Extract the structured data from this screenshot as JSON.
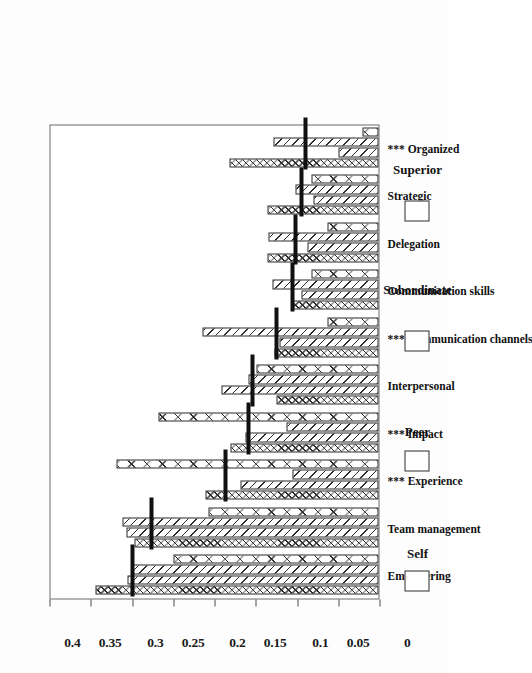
{
  "chart_data": {
    "type": "bar",
    "title": "",
    "xlabel": "",
    "ylabel": "",
    "ylim": [
      0,
      0.4
    ],
    "yticks": [
      "0",
      "0.05",
      "0.1",
      "0.15",
      "0.2",
      "0.25",
      "0.3",
      "0.35",
      "0.4"
    ],
    "ytick_values": [
      0,
      0.05,
      0.1,
      0.15,
      0.2,
      0.25,
      0.3,
      0.35,
      0.4
    ],
    "grid": false,
    "orientation": "vertical-bars-rotated-90",
    "legend_position": "bottom",
    "categories": [
      "Empowering",
      "Team management",
      "*** Experience",
      "*** Impact",
      "Interpersonal",
      "*** Communication channels",
      "Communication skills",
      "Delegation",
      "Strategic",
      "*** Organized"
    ],
    "series": [
      {
        "name": "Self",
        "pattern": "cross-hatch-dense",
        "values": [
          0.343,
          0.296,
          0.21,
          0.18,
          0.124,
          0.126,
          0.105,
          0.134,
          0.134,
          0.181
        ]
      },
      {
        "name": "Peer",
        "pattern": "diagonal-hatch",
        "values": [
          0.304,
          0.306,
          0.167,
          0.161,
          0.19,
          0.12,
          0.093,
          0.086,
          0.079,
          0.048
        ]
      },
      {
        "name": "Subordinate",
        "pattern": "diagonal-hatch-light",
        "values": [
          0.3,
          0.31,
          0.104,
          0.112,
          0.157,
          0.213,
          0.128,
          0.133,
          0.101,
          0.127
        ]
      },
      {
        "name": "Superior",
        "pattern": "cross-hatch-wide",
        "values": [
          0.248,
          0.206,
          0.317,
          0.267,
          0.148,
          0.062,
          0.081,
          0.062,
          0.081,
          0.02
        ]
      }
    ],
    "overlay": {
      "name": "Mean",
      "style": "thick black horizontal line",
      "values": [
        0.298,
        0.275,
        0.186,
        0.157,
        0.153,
        0.124,
        0.104,
        0.101,
        0.093,
        0.089
      ]
    },
    "legend": [
      "Self",
      "Peer",
      "Subordinate",
      "Superior"
    ]
  }
}
